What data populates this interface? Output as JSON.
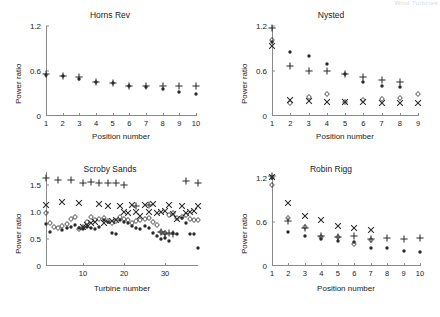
{
  "page_header": "Wind Turbines",
  "axis_colors": {
    "axis": "#8a8a8a",
    "text": "#1a1a1a",
    "marker": "#2a2a2a"
  },
  "series_names": [
    "dot",
    "plus",
    "cross",
    "diamond"
  ],
  "chart_data": [
    {
      "type": "scatter",
      "title": "Horns Rev",
      "xlabel": "Position number",
      "ylabel": "Power ratio",
      "xlim": [
        1,
        10
      ],
      "ylim": [
        0,
        1.2
      ],
      "xticks": [
        1,
        2,
        3,
        4,
        5,
        6,
        7,
        8,
        9,
        10
      ],
      "xticklabels": [
        "1",
        "2",
        "3",
        "4",
        "5",
        "6",
        "7",
        "8",
        "9",
        "10"
      ],
      "yticks": [
        0,
        0.6,
        1.2
      ],
      "yticklabels": [
        "0",
        "0.6",
        "1.2"
      ],
      "grid": false,
      "legend": "none",
      "x": [
        1,
        2,
        3,
        4,
        5,
        6,
        7,
        8,
        9,
        10
      ],
      "series": [
        {
          "name": "dot",
          "marker": "dot",
          "values": [
            0.55,
            0.53,
            0.5,
            0.45,
            0.44,
            0.4,
            0.385,
            0.365,
            0.325,
            0.295
          ]
        },
        {
          "name": "plus",
          "marker": "plus",
          "values": [
            0.56,
            0.535,
            0.525,
            0.455,
            0.445,
            0.405,
            0.4,
            0.395,
            0.4,
            0.395
          ]
        }
      ]
    },
    {
      "type": "scatter",
      "title": "Nysted",
      "xlabel": "Position number",
      "ylabel": "Power ratio",
      "xlim": [
        1,
        9
      ],
      "ylim": [
        0,
        1.2
      ],
      "xticks": [
        1,
        2,
        3,
        4,
        5,
        6,
        7,
        8,
        9
      ],
      "xticklabels": [
        "1",
        "2",
        "3",
        "4",
        "5",
        "6",
        "7",
        "8",
        "9"
      ],
      "yticks": [
        0,
        0.6,
        1.2
      ],
      "yticklabels": [
        "0",
        "0.6",
        "1.2"
      ],
      "grid": false,
      "legend": "none",
      "x": [
        1,
        2,
        3,
        4,
        5,
        6,
        7,
        8,
        9
      ],
      "series": [
        {
          "name": "dot",
          "marker": "dot",
          "values": [
            0.99,
            0.85,
            0.8,
            0.7,
            0.56,
            0.46,
            0.4,
            0.385,
            null
          ]
        },
        {
          "name": "plus",
          "marker": "plus",
          "values": [
            1.17,
            0.665,
            0.6,
            0.595,
            0.565,
            0.52,
            0.475,
            0.455,
            null
          ]
        },
        {
          "name": "cross",
          "marker": "cross",
          "values": [
            0.94,
            0.215,
            0.195,
            0.185,
            0.185,
            0.185,
            0.175,
            0.175,
            0.17
          ]
        },
        {
          "name": "diamond",
          "marker": "diamond",
          "values": [
            1.02,
            0.175,
            0.255,
            0.295,
            0.185,
            0.22,
            0.225,
            0.24,
            0.29
          ]
        }
      ]
    },
    {
      "type": "scatter",
      "title": "Scroby Sands",
      "xlabel": "Turbine number",
      "ylabel": "Power ratio",
      "xlim": [
        1,
        38
      ],
      "ylim": [
        0,
        1.75
      ],
      "xticks": [
        10,
        20,
        30
      ],
      "xticklabels": [
        "10",
        "20",
        "30"
      ],
      "yticks": [
        0,
        0.5,
        1.0,
        1.5
      ],
      "yticklabels": [
        "0",
        "0.5",
        "1.0",
        "1.5"
      ],
      "grid": false,
      "legend": "none",
      "x": [
        1,
        2,
        3,
        4,
        5,
        6,
        7,
        8,
        9,
        10,
        11,
        12,
        13,
        14,
        15,
        16,
        17,
        18,
        19,
        20,
        21,
        22,
        23,
        24,
        25,
        26,
        27,
        28,
        29,
        30,
        31,
        32,
        33,
        34,
        35,
        36,
        37,
        38
      ],
      "series": [
        {
          "name": "dot",
          "marker": "dot",
          "values": [
            0.79,
            0.64,
            null,
            null,
            0.67,
            0.7,
            0.72,
            0.76,
            0.7,
            0.69,
            0.73,
            0.7,
            0.69,
            0.72,
            0.85,
            0.82,
            0.62,
            0.6,
            0.85,
            0.82,
            0.8,
            0.74,
            0.7,
            0.68,
            0.74,
            0.7,
            0.62,
            0.55,
            0.51,
            0.53,
            0.47,
            0.62,
            0.6,
            0.9,
            0.8,
            0.59,
            0.6,
            0.34
          ]
        },
        {
          "name": "plus",
          "marker": "plus",
          "values": [
            1.63,
            null,
            null,
            1.6,
            null,
            null,
            1.61,
            null,
            null,
            1.55,
            null,
            1.56,
            null,
            1.55,
            null,
            1.55,
            null,
            1.54,
            null,
            1.51,
            null,
            null,
            1.12,
            null,
            null,
            1.14,
            null,
            null,
            0.63,
            0.6,
            0.62,
            0.6,
            null,
            null,
            1.59,
            null,
            null,
            1.54
          ]
        },
        {
          "name": "cross",
          "marker": "cross",
          "values": [
            1.13,
            null,
            null,
            null,
            1.19,
            null,
            null,
            null,
            1.17,
            0.73,
            0.76,
            0.8,
            0.82,
            1.15,
            0.8,
            1.12,
            0.84,
            0.86,
            1.12,
            1.01,
            0.98,
            1.14,
            1.0,
            0.93,
            1.13,
            1.0,
            1.15,
            0.98,
            1.0,
            1.02,
            1.13,
            0.97,
            0.88,
            1.12,
            0.98,
            1.0,
            1.02,
            1.12
          ]
        },
        {
          "name": "diamond",
          "marker": "diamond",
          "values": [
            0.98,
            0.8,
            0.72,
            0.7,
            0.74,
            0.78,
            0.88,
            0.92,
            0.68,
            0.72,
            0.82,
            0.92,
            0.86,
            0.88,
            0.9,
            0.84,
            0.8,
            0.84,
            0.92,
            0.88,
            0.86,
            0.8,
            0.84,
            0.86,
            0.88,
            0.9,
            0.82,
            0.76,
            0.64,
            0.62,
            0.95,
            0.98,
            0.9,
            0.92,
            0.95,
            0.88,
            0.86,
            0.85
          ]
        }
      ]
    },
    {
      "type": "scatter",
      "title": "Robin Rigg",
      "xlabel": "Position number",
      "ylabel": "Power ratio",
      "xlim": [
        1,
        10
      ],
      "ylim": [
        0,
        1.2
      ],
      "xticks": [
        1,
        2,
        3,
        4,
        5,
        6,
        7,
        8,
        9,
        10
      ],
      "xticklabels": [
        "1",
        "2",
        "3",
        "4",
        "5",
        "6",
        "7",
        "8",
        "9",
        "10"
      ],
      "yticks": [
        0,
        0.6,
        1.2
      ],
      "yticklabels": [
        "0",
        "0.6",
        "1.2"
      ],
      "grid": false,
      "legend": "none",
      "x": [
        1,
        2,
        3,
        4,
        5,
        6,
        7,
        8,
        9,
        10
      ],
      "series": [
        {
          "name": "dot",
          "marker": "dot",
          "values": [
            1.2,
            0.46,
            0.41,
            0.365,
            0.335,
            0.325,
            0.245,
            0.245,
            0.2,
            0.185
          ]
        },
        {
          "name": "plus",
          "marker": "plus",
          "values": [
            1.23,
            0.615,
            0.525,
            0.405,
            0.4,
            0.405,
            0.375,
            0.385,
            0.37,
            0.385
          ]
        },
        {
          "name": "cross",
          "marker": "cross",
          "values": [
            1.22,
            0.865,
            0.685,
            0.625,
            0.545,
            0.515,
            0.495,
            null,
            null,
            null
          ]
        },
        {
          "name": "diamond",
          "marker": "diamond",
          "values": [
            1.11,
            0.655,
            0.535,
            0.4,
            0.395,
            0.295,
            0.35,
            null,
            null,
            null
          ]
        }
      ]
    }
  ]
}
